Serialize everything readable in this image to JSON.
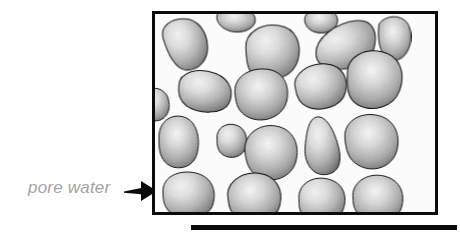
{
  "figure": {
    "label": {
      "text": "pore water",
      "color": "#a3a3a3"
    },
    "arrow": {
      "name": "leader-arrow",
      "direction": "right",
      "color": "#0b0b0b"
    },
    "box": {
      "name": "specimen-box",
      "border_color": "#0b0b0b",
      "border_width": 3,
      "pore_fill": "#fbfbfb",
      "x": 152,
      "y": 11,
      "width": 286,
      "height": 204
    },
    "base_line": {
      "name": "base-line",
      "color": "#0b0b0b",
      "x": 191,
      "y": 225,
      "width": 266,
      "height": 5
    },
    "grain_style": {
      "outline_color": "#121212",
      "outline_width": 2,
      "highlight_color": "#f2f2f2",
      "midtone_color": "#b4b4b4",
      "shadow_color": "#5e5e5e"
    },
    "grains": [
      {
        "name": "grain-top-left",
        "cx": 62,
        "cy": 62,
        "rx": 46,
        "ry": 52,
        "rot": -12,
        "hx": 32,
        "hy": 30,
        "path": "M 20 40 C 18 14, 44 4, 70 10 C 96 16, 108 44, 104 72 C 100 100, 78 116, 54 112 C 30 108, 22 66, 20 40 Z"
      },
      {
        "name": "grain-top-mid-left",
        "cx": 160,
        "cy": 16,
        "rx": 38,
        "ry": 22,
        "rot": 0,
        "hx": 38,
        "hy": 6,
        "path": "M 124 2 C 132 -14, 182 -16, 196 0 C 208 14, 196 34, 168 36 C 140 38, 120 18, 124 2 Z"
      },
      {
        "name": "grain-upper-2",
        "cx": 232,
        "cy": 88,
        "rx": 54,
        "ry": 48,
        "rot": 5,
        "hx": 54,
        "hy": 34,
        "path": "M 180 72 C 176 42, 206 20, 242 22 C 278 24, 292 56, 286 88 C 280 120, 244 138, 212 130 C 186 124, 184 98, 180 72 Z"
      },
      {
        "name": "grain-upper-3",
        "cx": 330,
        "cy": 22,
        "rx": 30,
        "ry": 18,
        "rot": 0,
        "hx": 30,
        "hy": 10,
        "path": "M 300 6 C 306 -12, 350 -16, 362 2 C 372 18, 358 38, 332 38 C 308 38, 296 20, 300 6 Z"
      },
      {
        "name": "grain-top-right-big",
        "cx": 382,
        "cy": 66,
        "rx": 62,
        "ry": 40,
        "rot": -14,
        "hx": 62,
        "hy": 30,
        "path": "M 320 66 C 326 34, 374 14, 416 20 C 450 26, 450 56, 436 82 C 420 110, 372 116, 342 100 C 322 90, 318 80, 320 66 Z"
      },
      {
        "name": "grain-right-edge-top",
        "cx": 478,
        "cy": 48,
        "rx": 32,
        "ry": 42,
        "rot": 0,
        "hx": 20,
        "hy": 30,
        "path": "M 448 20 C 462 0, 498 0, 508 24 C 518 50, 508 86, 484 92 C 458 98, 442 66, 448 20 Z"
      },
      {
        "name": "grain-mid-left-slab",
        "cx": 98,
        "cy": 158,
        "rx": 54,
        "ry": 34,
        "rot": 8,
        "hx": 60,
        "hy": 26,
        "path": "M 46 150 C 44 122, 80 108, 116 116 C 148 124, 158 150, 150 172 C 142 196, 92 202, 66 188 C 50 178, 46 166, 46 150 Z"
      },
      {
        "name": "grain-center",
        "cx": 212,
        "cy": 160,
        "rx": 52,
        "ry": 46,
        "rot": 0,
        "hx": 56,
        "hy": 38,
        "path": "M 160 160 C 156 128, 186 108, 220 110 C 256 112, 270 142, 264 172 C 258 204, 220 220, 190 208 C 166 198, 162 180, 160 160 Z"
      },
      {
        "name": "grain-mid-right-a",
        "cx": 330,
        "cy": 140,
        "rx": 50,
        "ry": 38,
        "rot": -8,
        "hx": 52,
        "hy": 30,
        "path": "M 280 142 C 276 114, 312 94, 348 102 C 382 110, 388 140, 378 164 C 366 192, 320 198, 296 180 C 282 170, 280 156, 280 142 Z"
      },
      {
        "name": "grain-right-big",
        "cx": 436,
        "cy": 128,
        "rx": 56,
        "ry": 50,
        "rot": 6,
        "hx": 56,
        "hy": 40,
        "path": "M 384 124 C 380 92, 412 70, 448 74 C 486 78, 500 112, 492 146 C 484 182, 442 198, 410 184 C 388 174, 386 150, 384 124 Z"
      },
      {
        "name": "grain-left-edge-mid",
        "cx": 8,
        "cy": 176,
        "rx": 22,
        "ry": 26,
        "rot": 0,
        "hx": 2,
        "hy": 16,
        "path": "M -20 160 C -10 142, 18 146, 26 168 C 34 192, 22 214, 0 214 C -22 214, -28 182, -20 160 Z"
      },
      {
        "name": "grain-left-lower",
        "cx": 46,
        "cy": 252,
        "rx": 38,
        "ry": 44,
        "rot": 0,
        "hx": 34,
        "hy": 34,
        "path": "M 8 250 C 6 216, 32 198, 58 206 C 84 214, 92 250, 84 280 C 76 310, 38 316, 20 296 C 8 282, 8 266, 8 250 Z"
      },
      {
        "name": "grain-mid-lower-small",
        "cx": 152,
        "cy": 252,
        "rx": 28,
        "ry": 26,
        "rot": 0,
        "hx": 26,
        "hy": 18,
        "path": "M 124 250 C 122 228, 142 216, 162 222 C 182 228, 188 252, 180 270 C 172 290, 142 292, 130 276 C 124 268, 124 258, 124 250 Z"
      },
      {
        "name": "grain-center-lower",
        "cx": 232,
        "cy": 270,
        "rx": 54,
        "ry": 50,
        "rot": 0,
        "hx": 58,
        "hy": 42,
        "path": "M 180 276 C 176 242, 208 218, 242 224 C 278 230, 290 264, 282 294 C 274 328, 232 342, 204 324 C 186 312, 182 294, 180 276 Z"
      },
      {
        "name": "grain-lower-right-tri",
        "cx": 336,
        "cy": 258,
        "rx": 40,
        "ry": 48,
        "rot": 0,
        "hx": 34,
        "hy": 38,
        "path": "M 316 210 C 330 198, 348 212, 360 244 C 374 280, 376 312, 348 320 C 318 328, 298 300, 300 268 C 302 242, 306 218, 316 210 Z"
      },
      {
        "name": "grain-right-lower-big",
        "cx": 430,
        "cy": 250,
        "rx": 52,
        "ry": 46,
        "rot": 0,
        "hx": 52,
        "hy": 36,
        "path": "M 380 250 C 376 218, 406 196, 442 202 C 478 208, 492 240, 484 272 C 476 306, 436 320, 406 302 C 386 290, 382 272, 380 250 Z"
      },
      {
        "name": "grain-bottom-left",
        "cx": 66,
        "cy": 360,
        "rx": 48,
        "ry": 38,
        "rot": 0,
        "hx": 50,
        "hy": 28,
        "path": "M 16 356 C 14 326, 48 310, 82 318 C 114 326, 124 354, 116 380 C 108 410, 58 420, 34 400 C 18 388, 16 372, 16 356 Z"
      },
      {
        "name": "grain-bottom-mid",
        "cx": 196,
        "cy": 366,
        "rx": 50,
        "ry": 42,
        "rot": -6,
        "hx": 52,
        "hy": 32,
        "path": "M 146 366 C 142 334, 176 312, 212 320 C 248 328, 258 360, 248 388 C 238 418, 188 426, 164 406 C 148 394, 146 382, 146 366 Z"
      },
      {
        "name": "grain-bottom-right-a",
        "cx": 330,
        "cy": 372,
        "rx": 44,
        "ry": 38,
        "rot": 0,
        "hx": 44,
        "hy": 30,
        "path": "M 288 372 C 284 342, 314 322, 346 330 C 378 338, 386 366, 376 392 C 366 420, 320 428, 300 408 C 288 396, 288 384, 288 372 Z"
      },
      {
        "name": "grain-bottom-right-b",
        "cx": 440,
        "cy": 368,
        "rx": 46,
        "ry": 40,
        "rot": 0,
        "hx": 46,
        "hy": 30,
        "path": "M 396 368 C 392 338, 424 316, 458 324 C 492 332, 502 362, 492 390 C 482 418, 432 428, 412 406 C 398 392, 396 382, 396 368 Z"
      }
    ]
  }
}
